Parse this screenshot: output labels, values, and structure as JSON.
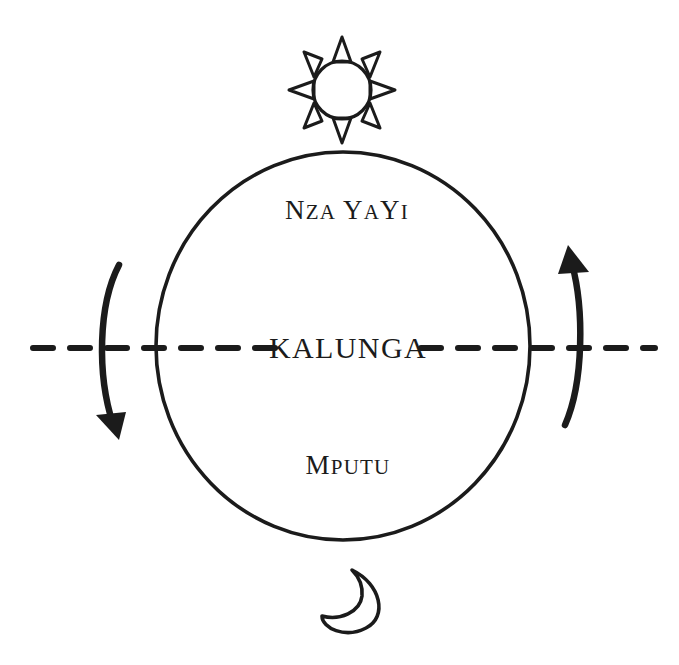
{
  "diagram": {
    "colors": {
      "ink": "#1b1b1b",
      "background": "#ffffff"
    },
    "labels": {
      "upper_world": {
        "full": "Nza YaYi",
        "part_1_cap": "N",
        "part_1_small": "ZA",
        "part_2_cap": "Y",
        "part_2_small": "A",
        "part_3_cap": "Y",
        "part_3_small": "I"
      },
      "axis": {
        "full": "KALUNGA"
      },
      "lower_world": {
        "full": "Mputu",
        "part_1_cap": "M",
        "part_1_small": "PUTU"
      }
    },
    "icons": {
      "sun": "sun-icon",
      "moon": "crescent-moon-icon",
      "left_arrow": "curved-arrow-down-icon",
      "right_arrow": "curved-arrow-up-icon"
    },
    "geometry": {
      "circle_center_x": 343,
      "circle_center_y": 346,
      "circle_radius_x": 187,
      "circle_radius_y": 194,
      "axis_y": 348,
      "axis_start_x": 33,
      "axis_end_x": 655,
      "sun_center_x": 342,
      "sun_center_y": 90,
      "moon_center_x": 350,
      "moon_center_y": 597
    }
  }
}
